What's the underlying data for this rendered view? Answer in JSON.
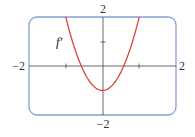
{
  "chart_data": {
    "type": "line",
    "title": "",
    "xlabel": "",
    "ylabel": "",
    "xlim": [
      -2,
      2
    ],
    "ylim": [
      -2,
      2
    ],
    "grid": false,
    "legend": "none",
    "x_tick_labels": [
      "-2",
      "2"
    ],
    "y_tick_labels": [
      "2",
      "-2"
    ],
    "x_ticks": [
      -1,
      1
    ],
    "y_ticks": [
      1
    ],
    "annotations": [
      {
        "text": "f′",
        "x": -1.3,
        "y": 0.9
      }
    ],
    "series": [
      {
        "name": "f′",
        "formula": "3x^2 - 1",
        "x": [
          -1.0,
          -0.8,
          -0.6,
          -0.577,
          -0.4,
          -0.2,
          0.0,
          0.2,
          0.4,
          0.577,
          0.6,
          0.8,
          1.0
        ],
        "y": [
          2.0,
          0.92,
          0.08,
          0.0,
          -0.52,
          -0.88,
          -1.0,
          -0.88,
          -0.52,
          0.0,
          0.08,
          0.92,
          2.0
        ]
      }
    ]
  },
  "labels": {
    "x_min": "−2",
    "x_max": "2",
    "y_max": "2",
    "y_min": "−2",
    "curve": "f′"
  },
  "colors": {
    "frame": "#8a9fd4",
    "curve": "#d9453a",
    "axes": "#444444"
  }
}
